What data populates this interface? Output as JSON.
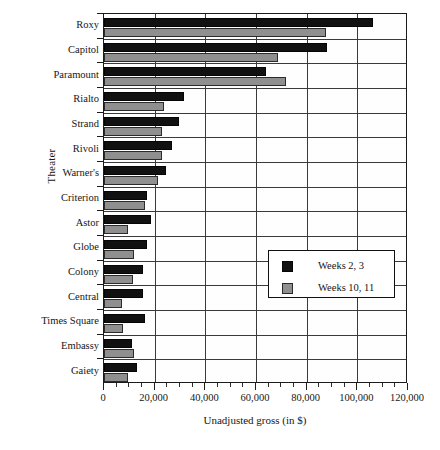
{
  "chart_data": {
    "type": "bar",
    "orientation": "horizontal",
    "title": "",
    "xlabel": "Unadjusted gross (in $)",
    "ylabel": "Theater",
    "xlim": [
      0,
      120000
    ],
    "xticks": [
      0,
      20000,
      40000,
      60000,
      80000,
      100000,
      120000
    ],
    "xtick_labels": [
      "0",
      "20,000",
      "40,000",
      "60,000",
      "80,000",
      "100,000",
      "120,000"
    ],
    "minor_ticks": true,
    "grid": "vertical-and-horizontal",
    "categories": [
      "Roxy",
      "Capitol",
      "Paramount",
      "Rialto",
      "Strand",
      "Rivoli",
      "Warner's",
      "Criterion",
      "Astor",
      "Globe",
      "Colony",
      "Central",
      "Times Square",
      "Embassy",
      "Gaiety"
    ],
    "series": [
      {
        "name": "Weeks 2, 3",
        "color": "#111111",
        "values": [
          106000,
          88000,
          64000,
          31500,
          29500,
          27000,
          24500,
          17000,
          18500,
          17000,
          15500,
          15500,
          16000,
          11000,
          13000
        ]
      },
      {
        "name": "Weeks 10, 11",
        "color": "#8f8f8f",
        "values": [
          87500,
          68500,
          72000,
          23500,
          23000,
          23000,
          21500,
          16000,
          9500,
          12000,
          11500,
          7000,
          7500,
          12000,
          9500
        ]
      }
    ],
    "legend": {
      "position": "center-right",
      "entries": [
        {
          "label": "Weeks 2, 3",
          "swatch": "black"
        },
        {
          "label": "Weeks 10, 11",
          "swatch": "gray"
        }
      ]
    }
  }
}
